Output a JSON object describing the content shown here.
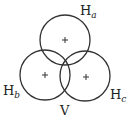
{
  "diagram": {
    "circles": [
      {
        "id": "top",
        "cx": 65,
        "cy": 40,
        "r": 25,
        "marker": "+"
      },
      {
        "id": "bottom-left",
        "cx": 45,
        "cy": 75,
        "r": 25,
        "marker": "+"
      },
      {
        "id": "bottom-right",
        "cx": 85,
        "cy": 76,
        "r": 25,
        "marker": "+"
      }
    ],
    "labels": {
      "ha": {
        "base": "H",
        "sub": "a"
      },
      "hb": {
        "base": "H",
        "sub": "b"
      },
      "hc": {
        "base": "H",
        "sub": "c"
      },
      "v": "V"
    },
    "stroke_color": "#333333"
  }
}
